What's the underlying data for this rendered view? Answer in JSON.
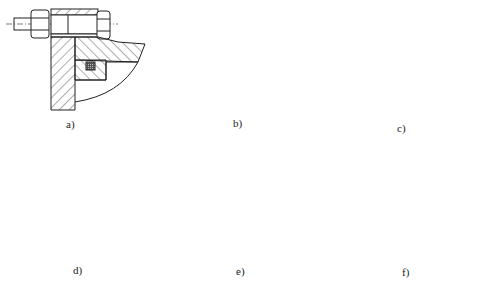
{
  "header": {
    "text": ""
  },
  "figure": {
    "panels": [
      {
        "id": "a",
        "label": "a)",
        "features": [
          "bolt-with-nuts",
          "hatched-flange",
          "o-ring-seal"
        ]
      },
      {
        "id": "b",
        "label": "b)",
        "features": [
          "stud-bolt",
          "curved-housing",
          "o-ring-seal",
          "nut"
        ]
      },
      {
        "id": "c",
        "label": "c)",
        "features": [
          "curved-housing",
          "o-ring-seal",
          "threaded-ring",
          "sleeve"
        ]
      },
      {
        "id": "d",
        "label": "d)",
        "features": [
          "housing",
          "insert-block",
          "o-ring-seal"
        ]
      },
      {
        "id": "e",
        "label": "e)",
        "features": [
          "bolt-with-nut",
          "hatched-flange",
          "o-ring-seal"
        ]
      },
      {
        "id": "f",
        "label": "f)",
        "features": [
          "welded-joint",
          "hatched-plate"
        ]
      }
    ]
  },
  "colors": {
    "line": "#222222",
    "hatch": "#333333",
    "seal": "#444444",
    "weld": "#111111"
  }
}
